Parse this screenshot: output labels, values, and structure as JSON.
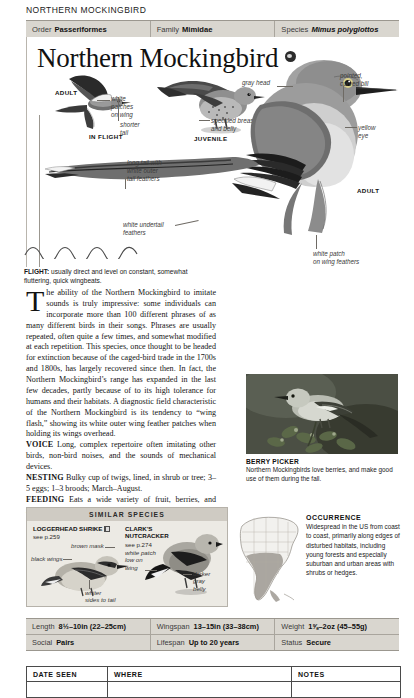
{
  "running_head": "NORTHERN MOCKINGBIRD",
  "taxonomy": {
    "order": {
      "label": "Order",
      "value": "Passeriformes"
    },
    "family": {
      "label": "Family",
      "value": "Mimidae"
    },
    "species": {
      "label": "Species",
      "value": "Mimus polyglottos"
    }
  },
  "title": "Northern Mockingbird",
  "title_icon": "audio-marker-icon",
  "plate": {
    "labels": [
      {
        "name": "adult-flight-label",
        "text": "ADULT"
      },
      {
        "name": "in-flight-label",
        "text": "IN FLIGHT"
      },
      {
        "name": "juvenile-label",
        "text": "JUVENILE"
      },
      {
        "name": "adult-label",
        "text": "ADULT"
      }
    ],
    "annotations": [
      {
        "name": "white-patches-on-wing",
        "text": "white\npatches\non wing"
      },
      {
        "name": "shorter-tail",
        "text": "shorter\ntail"
      },
      {
        "name": "speckled-breast-and-belly",
        "text": "speckled breast\nand belly"
      },
      {
        "name": "gray-head",
        "text": "gray head"
      },
      {
        "name": "pointed-curved-bill",
        "text": "pointed,\ncurved bill"
      },
      {
        "name": "yellow-eye",
        "text": "yellow\neye"
      },
      {
        "name": "long-tail-white-outer",
        "text": "long tail with\nwhite outer\ntail feathers"
      },
      {
        "name": "white-undertail-feathers",
        "text": "white undertail\nfeathers"
      },
      {
        "name": "white-patch-on-wing-feathers",
        "text": "white patch\non wing feathers"
      }
    ]
  },
  "flight_note": {
    "label": "FLIGHT:",
    "text": " usually direct and level on constant, somewhat fluttering, quick wingbeats."
  },
  "body": {
    "dropcap": "T",
    "paragraph": "he ability of the Northern Mockingbird to imitate sounds is truly impressive: some individuals can incorporate more than 100 different phrases of as many different birds in their songs. Phrases are usually repeated, often quite a few times, and somewhat modified at each repetition. This species, once thought to be headed for extinction because of the caged-bird trade in the 1700s and 1800s, has largely recovered since then. In fact, the Northern Mockingbird’s range has expanded in the last few decades, partly because of to its high tolerance for humans and their habitats. A diagnostic field characteristic of the Northern Mockingbird is its tendency to “wing flash,” showing its white outer wing feather patches when holding its wings overhead.",
    "sections": [
      {
        "label": "VOICE",
        "text": "Long, complex repertoire often imitating other birds, non-bird noises, and the sounds of mechanical devices."
      },
      {
        "label": "NESTING",
        "text": "Bulky cup of twigs, lined, in shrub or tree; 3–5 eggs; 1–3 broods; March–August."
      },
      {
        "label": "FEEDING",
        "text": "Eats a wide variety of fruit, berries, and insects, including ants, beetles, and grasshoppers."
      }
    ]
  },
  "photo": {
    "caption_title": "BERRY PICKER",
    "caption_text": "Northern Mockingbirds love berries, and make good use of them during the fall."
  },
  "occurrence": {
    "title": "OCCURRENCE",
    "text": "Widespread in the US from coast to coast, primarily along edges of disturbed habitats, including young forests and especially suburban and urban areas with shrubs or hedges."
  },
  "similar_species": {
    "heading": "SIMILAR SPECIES",
    "entries": [
      {
        "name": "Loggerhead Shrike",
        "display_name": "LOGGERHEAD SHRIKE",
        "page_ref": "see p.259",
        "annotations": [
          {
            "name": "brown-mask",
            "text": "brown mask"
          },
          {
            "name": "black-wings",
            "text": "black wings"
          },
          {
            "name": "whiter-sides-to-tail",
            "text": "whiter\nsides to tail"
          }
        ]
      },
      {
        "name": "Clark's Nutcracker",
        "display_name": "CLARK’S\nNUTCRACKER",
        "page_ref": "see p.274",
        "annotations": [
          {
            "name": "white-patch-low-on-wing",
            "text": "white patch\nlow on\nwing"
          },
          {
            "name": "darker-gray-belly",
            "text": "darker\ngray\nbelly"
          }
        ]
      }
    ]
  },
  "stats": [
    [
      {
        "label": "Length",
        "value": "8½–10in (22–25cm)"
      },
      {
        "label": "Wingspan",
        "value": "13–15in (33–38cm)"
      },
      {
        "label": "Weight",
        "value": "1⅝–2oz (45–55g)"
      }
    ],
    [
      {
        "label": "Social",
        "value": "Pairs"
      },
      {
        "label": "Lifespan",
        "value": "Up to 20 years"
      },
      {
        "label": "Status",
        "value": "Secure"
      }
    ]
  ],
  "log_table": {
    "columns": [
      "DATE SEEN",
      "WHERE",
      "NOTES"
    ],
    "rows": [
      [
        "",
        "",
        ""
      ]
    ]
  }
}
